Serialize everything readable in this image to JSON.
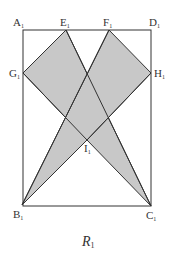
{
  "figure": {
    "caption": {
      "main": "R",
      "sub": "1"
    },
    "colors": {
      "shade": "#c8c8c8",
      "stroke": "#333333",
      "background": "#ffffff"
    },
    "rectangle": {
      "vertices": [
        "A1",
        "D1",
        "C1",
        "B1"
      ]
    },
    "shaded_regions": [
      {
        "name": "quad-GECI",
        "vertices": [
          "G1",
          "E1",
          "C1",
          "I1"
        ]
      },
      {
        "name": "quad-FHIB",
        "vertices": [
          "F1",
          "H1",
          "I1",
          "B1"
        ]
      }
    ],
    "points": {
      "A1": {
        "main": "A",
        "sub": "1"
      },
      "E1": {
        "main": "E",
        "sub": "1"
      },
      "F1": {
        "main": "F",
        "sub": "1"
      },
      "D1": {
        "main": "D",
        "sub": "1"
      },
      "G1": {
        "main": "G",
        "sub": "1"
      },
      "H1": {
        "main": "H",
        "sub": "1"
      },
      "I1": {
        "main": "I",
        "sub": "1"
      },
      "B1": {
        "main": "B",
        "sub": "1"
      },
      "C1": {
        "main": "C",
        "sub": "1"
      }
    }
  }
}
